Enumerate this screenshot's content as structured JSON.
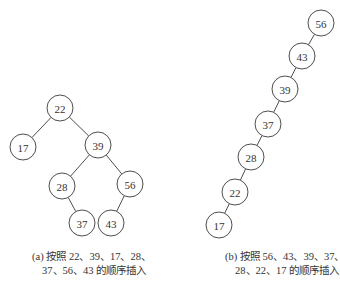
{
  "figure": {
    "tree_a": {
      "caption_line1": "(a) 按照 22、39、17、28、",
      "caption_line2": "37、56、43 的顺序插入",
      "insertion_order": [
        22,
        39,
        17,
        28,
        37,
        56,
        43
      ],
      "nodes": [
        {
          "id": "22",
          "label": "22",
          "x": 60,
          "y": 108
        },
        {
          "id": "17",
          "label": "17",
          "x": 23,
          "y": 147
        },
        {
          "id": "39",
          "label": "39",
          "x": 98,
          "y": 145
        },
        {
          "id": "28",
          "label": "28",
          "x": 62,
          "y": 186
        },
        {
          "id": "56",
          "label": "56",
          "x": 130,
          "y": 184
        },
        {
          "id": "37",
          "label": "37",
          "x": 82,
          "y": 223
        },
        {
          "id": "43",
          "label": "43",
          "x": 111,
          "y": 223
        }
      ],
      "edges": [
        [
          "22",
          "17"
        ],
        [
          "22",
          "39"
        ],
        [
          "39",
          "28"
        ],
        [
          "39",
          "56"
        ],
        [
          "28",
          "37"
        ],
        [
          "56",
          "43"
        ]
      ]
    },
    "tree_b": {
      "caption_line1": "(b) 按照 56、43、39、37、",
      "caption_line2": "28、22、17 的顺序插入",
      "insertion_order": [
        56,
        43,
        39,
        37,
        28,
        22,
        17
      ],
      "nodes": [
        {
          "id": "56",
          "label": "56",
          "x": 321,
          "y": 23
        },
        {
          "id": "43",
          "label": "43",
          "x": 302,
          "y": 56
        },
        {
          "id": "39",
          "label": "39",
          "x": 285,
          "y": 89
        },
        {
          "id": "37",
          "label": "37",
          "x": 268,
          "y": 124
        },
        {
          "id": "28",
          "label": "28",
          "x": 251,
          "y": 157
        },
        {
          "id": "22",
          "label": "22",
          "x": 235,
          "y": 192
        },
        {
          "id": "17",
          "label": "17",
          "x": 219,
          "y": 225
        }
      ],
      "edges": [
        [
          "56",
          "43"
        ],
        [
          "43",
          "39"
        ],
        [
          "39",
          "37"
        ],
        [
          "37",
          "28"
        ],
        [
          "28",
          "22"
        ],
        [
          "22",
          "17"
        ]
      ]
    },
    "node_radius": 13
  }
}
